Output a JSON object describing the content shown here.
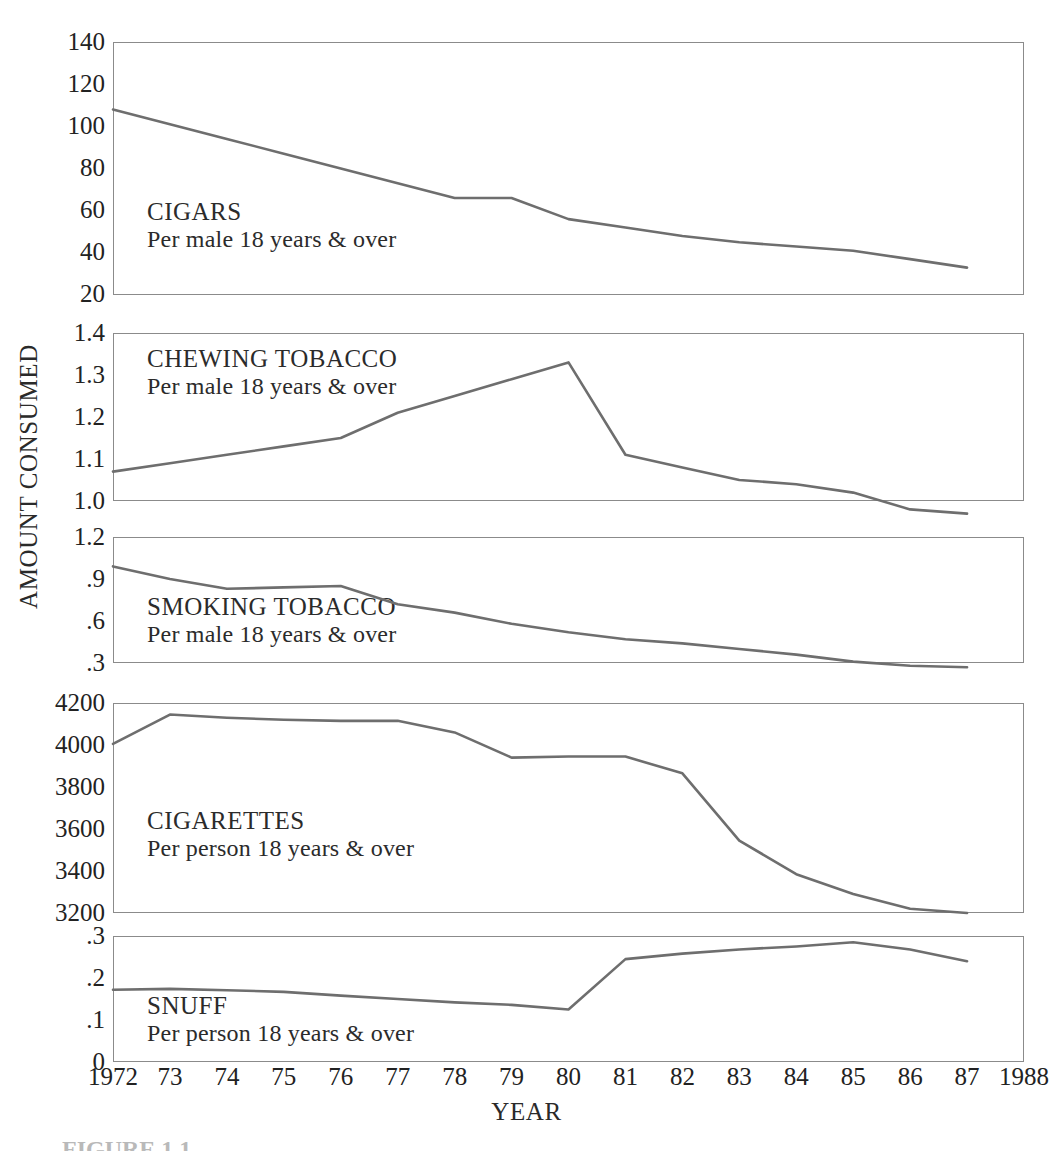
{
  "figure": {
    "y_axis_title": "AMOUNT CONSUMED",
    "x_axis_title": "YEAR",
    "caption": "FIGURE 1.1",
    "line_color": "#6e6e6e",
    "axis_color": "#8b8b8b",
    "text_color": "#2b2b2b"
  },
  "x_ticks": [
    "1972",
    "73",
    "74",
    "75",
    "76",
    "77",
    "78",
    "79",
    "80",
    "81",
    "82",
    "83",
    "84",
    "85",
    "86",
    "87",
    "1988"
  ],
  "panels": [
    {
      "id": "cigars",
      "title": "CIGARS",
      "subtitle": "Per male 18 years & over",
      "y_ticks": [
        "140",
        "120",
        "100",
        "80",
        "60",
        "40",
        "20"
      ]
    },
    {
      "id": "chewing-tobacco",
      "title": "CHEWING TOBACCO",
      "subtitle": "Per male 18 years & over",
      "y_ticks": [
        "1.4",
        "1.3",
        "1.2",
        "1.1",
        "1.0"
      ]
    },
    {
      "id": "smoking-tobacco",
      "title": "SMOKING TOBACCO",
      "subtitle": "Per male 18 years & over",
      "y_ticks": [
        "1.2",
        ".9",
        ".6",
        ".3"
      ]
    },
    {
      "id": "cigarettes",
      "title": "CIGARETTES",
      "subtitle": "Per person 18 years & over",
      "y_ticks": [
        "4200",
        "4000",
        "3800",
        "3600",
        "3400",
        "3200"
      ]
    },
    {
      "id": "snuff",
      "title": "SNUFF",
      "subtitle": "Per person 18 years & over",
      "y_ticks": [
        ".3",
        ".2",
        ".1",
        "0"
      ]
    }
  ],
  "chart_data": {
    "type": "line",
    "title": "",
    "xlabel": "YEAR",
    "ylabel": "AMOUNT CONSUMED",
    "grid": false,
    "legend": "none",
    "x": [
      1972,
      1973,
      1974,
      1975,
      1976,
      1977,
      1978,
      1979,
      1980,
      1981,
      1982,
      1983,
      1984,
      1985,
      1986,
      1987
    ],
    "xlim": [
      1972,
      1988
    ],
    "xticks": [
      1972,
      1973,
      1974,
      1975,
      1976,
      1977,
      1978,
      1979,
      1980,
      1981,
      1982,
      1983,
      1984,
      1985,
      1986,
      1987,
      1988
    ],
    "panels": [
      {
        "name": "CIGARS",
        "sublabel": "Per male 18 years & over",
        "ylabel_ticks": [
          140,
          120,
          100,
          80,
          60,
          40,
          20
        ],
        "ylim": [
          20,
          140
        ],
        "values": [
          108,
          101,
          94,
          87,
          80,
          73,
          66,
          66,
          56,
          52,
          48,
          45,
          43,
          41,
          37,
          33
        ]
      },
      {
        "name": "CHEWING TOBACCO",
        "sublabel": "Per male 18 years & over",
        "ylabel_ticks": [
          1.4,
          1.3,
          1.2,
          1.1,
          1.0
        ],
        "ylim": [
          1.0,
          1.4
        ],
        "values": [
          1.07,
          1.09,
          1.11,
          1.13,
          1.15,
          1.21,
          1.25,
          1.29,
          1.33,
          1.11,
          1.08,
          1.05,
          1.04,
          1.02,
          0.98,
          0.97
        ]
      },
      {
        "name": "SMOKING TOBACCO",
        "sublabel": "Per male 18 years & over",
        "ylabel_ticks": [
          1.2,
          0.9,
          0.6,
          0.3
        ],
        "ylim": [
          0.3,
          1.2
        ],
        "values": [
          0.99,
          0.9,
          0.83,
          0.84,
          0.85,
          0.72,
          0.66,
          0.58,
          0.52,
          0.47,
          0.44,
          0.4,
          0.36,
          0.31,
          0.28,
          0.27
        ]
      },
      {
        "name": "CIGARETTES",
        "sublabel": "Per person 18 years & over",
        "ylabel_ticks": [
          4200,
          4000,
          3800,
          3600,
          3400,
          3200
        ],
        "ylim": [
          3200,
          4200
        ],
        "values": [
          4005,
          4145,
          4130,
          4120,
          4115,
          4115,
          4060,
          3940,
          3945,
          3945,
          3865,
          3545,
          3385,
          3290,
          3220,
          3200
        ]
      },
      {
        "name": "SNUFF",
        "sublabel": "Per person 18 years & over",
        "ylabel_ticks": [
          0.3,
          0.2,
          0.1,
          0
        ],
        "ylim": [
          0,
          0.3
        ],
        "values": [
          0.172,
          0.174,
          0.171,
          0.167,
          0.158,
          0.15,
          0.142,
          0.136,
          0.125,
          0.245,
          0.258,
          0.268,
          0.275,
          0.285,
          0.268,
          0.24
        ]
      }
    ]
  }
}
